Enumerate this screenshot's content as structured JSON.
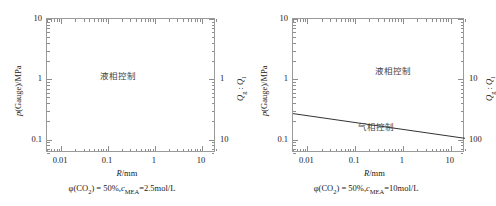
{
  "figure": {
    "type": "two-panel-log-log-regime-diagram",
    "panels": [
      {
        "id": "left",
        "caption": "φ(CO₂) = 50%, c_MEA = 2.5 mol/L",
        "caption_parts": {
          "phi": "φ(CO",
          "phi_sub": "2",
          "phi_close": ") = 50%,",
          "c": "c",
          "c_sub": "MEA",
          "c_val": "=2.5mol/L"
        },
        "xaxis": {
          "label": "R/mm",
          "label_italic": "R",
          "label_rest": "/mm",
          "scale": "log",
          "min": 0.005,
          "max": 20,
          "ticks": [
            "0.01",
            "0.1",
            "1",
            "10"
          ],
          "tick_values": [
            0.01,
            0.1,
            1,
            10
          ]
        },
        "yaxis": {
          "label": "p(Gauge)/MPa",
          "label_italic": "p",
          "label_rest": "(Gauge)/MPa",
          "scale": "log",
          "min": 0.06,
          "max": 10,
          "ticks": [
            "0.1",
            "1",
            "10"
          ],
          "tick_values": [
            0.1,
            1,
            10
          ]
        },
        "y2axis": {
          "label": "Qg : Ql",
          "label_q": "Q",
          "label_sub1": "g",
          "label_colon": " : ",
          "label_sub2": "l",
          "scale": "log-inverted",
          "ticks": [
            "1",
            "10"
          ],
          "tick_values": [
            1,
            10
          ]
        },
        "regions": [
          {
            "name": "liquid-phase-control",
            "text": "液相控制",
            "x_frac": 0.42,
            "y_frac": 0.42
          }
        ],
        "boundary_curve": null
      },
      {
        "id": "right",
        "caption": "φ(CO₂) = 50%, c_MEA = 10 mol/L",
        "caption_parts": {
          "phi": "φ(CO",
          "phi_sub": "2",
          "phi_close": ") = 50%,",
          "c": "c",
          "c_sub": "MEA",
          "c_val": "=10mol/L"
        },
        "xaxis": {
          "label": "R/mm",
          "label_italic": "R",
          "label_rest": "/mm",
          "scale": "log",
          "min": 0.005,
          "max": 20,
          "ticks": [
            "0.01",
            "0.1",
            "1",
            "10"
          ],
          "tick_values": [
            0.01,
            0.1,
            1,
            10
          ]
        },
        "yaxis": {
          "label": "p(Gauge)/MPa",
          "label_italic": "p",
          "label_rest": "(Gauge)/MPa",
          "scale": "log",
          "min": 0.06,
          "max": 10,
          "ticks": [
            "0.1",
            "1",
            "10"
          ],
          "tick_values": [
            0.1,
            1,
            10
          ]
        },
        "y2axis": {
          "label": "Qg : Ql",
          "label_q": "Q",
          "label_sub1": "g",
          "label_colon": " : ",
          "label_sub2": "l",
          "scale": "log-inverted",
          "ticks": [
            "10",
            "100"
          ],
          "tick_values": [
            10,
            100
          ]
        },
        "regions": [
          {
            "name": "liquid-phase-control",
            "text": "液相控制",
            "x_frac": 0.58,
            "y_frac": 0.38
          },
          {
            "name": "gas-phase-control",
            "text": "气相控制",
            "x_frac": 0.48,
            "y_frac": 0.8
          }
        ],
        "boundary_curve": {
          "name": "regime-boundary-line",
          "style": "solid",
          "color": "#333333",
          "points": [
            {
              "R": 0.005,
              "p": 0.27
            },
            {
              "R": 20,
              "p": 0.105
            }
          ]
        }
      }
    ]
  },
  "chart_data": {
    "type": "line",
    "title": "",
    "subtitle": "",
    "xlabel": "R/mm",
    "ylabel": "p(Gauge)/MPa",
    "y2label": "Qg : Ql",
    "xscale": "log",
    "yscale": "log",
    "xlim": [
      0.005,
      20
    ],
    "ylim": [
      0.06,
      10
    ],
    "grid": false,
    "legend": "none",
    "panels": [
      {
        "name": "phi(CO2)=50%, cMEA=2.5mol/L",
        "xticks": [
          0.01,
          0.1,
          1,
          10
        ],
        "xticklabels": [
          "0.01",
          "0.1",
          "1",
          "10"
        ],
        "yticks": [
          0.1,
          1,
          10
        ],
        "yticklabels": [
          "0.1",
          "1",
          "10"
        ],
        "y2ticks": [
          1,
          10
        ],
        "y2ticklabels": [
          "1",
          "10"
        ],
        "series": [],
        "annotations": [
          {
            "text": "液相控制",
            "R": 0.25,
            "p": 1.0
          }
        ]
      },
      {
        "name": "phi(CO2)=50%, cMEA=10mol/L",
        "xticks": [
          0.01,
          0.1,
          1,
          10
        ],
        "xticklabels": [
          "0.01",
          "0.1",
          "1",
          "10"
        ],
        "yticks": [
          0.1,
          1,
          10
        ],
        "yticklabels": [
          "0.1",
          "1",
          "10"
        ],
        "y2ticks": [
          10,
          100
        ],
        "y2ticklabels": [
          "10",
          "100"
        ],
        "series": [
          {
            "name": "regime boundary",
            "x": [
              0.005,
              0.01,
              0.1,
              1,
              10,
              20
            ],
            "y": [
              0.27,
              0.258,
              0.204,
              0.162,
              0.128,
              0.105
            ]
          }
        ],
        "annotations": [
          {
            "text": "液相控制",
            "R": 1.2,
            "p": 1.0
          },
          {
            "text": "气相控制",
            "R": 0.35,
            "p": 0.115
          }
        ]
      }
    ]
  }
}
